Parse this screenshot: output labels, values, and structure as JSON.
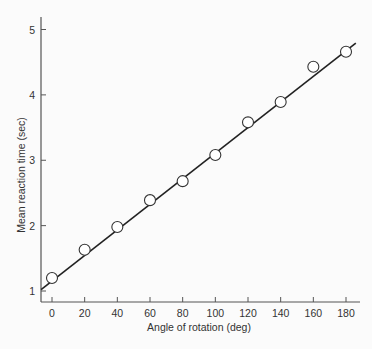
{
  "chart_data": {
    "type": "scatter",
    "title": "",
    "xlabel": "Angle of rotation (deg)",
    "ylabel": "Mean reaction time (sec)",
    "x_ticks": [
      0,
      20,
      40,
      60,
      80,
      100,
      120,
      140,
      160,
      180
    ],
    "y_ticks": [
      1,
      2,
      3,
      4,
      5
    ],
    "xlim": [
      -7,
      190
    ],
    "ylim": [
      0.83,
      5.25
    ],
    "grid": false,
    "legend": null,
    "series": [
      {
        "name": "Observed means",
        "marker": "open-circle",
        "x": [
          0,
          20,
          40,
          60,
          80,
          100,
          120,
          140,
          160,
          180
        ],
        "y": [
          1.2,
          1.63,
          1.98,
          2.39,
          2.68,
          3.08,
          3.58,
          3.89,
          4.43,
          4.66
        ]
      },
      {
        "name": "Linear fit",
        "style": "line",
        "x": [
          -6.7,
          186
        ],
        "y": [
          1.02,
          4.79
        ]
      }
    ]
  },
  "colors": {
    "background": "#fbfbfb",
    "axis": "#555555",
    "fit_line": "#222222",
    "marker_stroke": "#333333",
    "marker_fill": "#ffffff",
    "text": "#333333"
  }
}
